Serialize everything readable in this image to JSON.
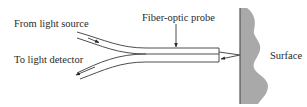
{
  "diagram": {
    "labels": {
      "source": "From light source",
      "detector": "To light detector",
      "probe": "Fiber-optic probe",
      "surface": "Surface"
    },
    "colors": {
      "line": "#3a3a3a",
      "surface_fill": "#a9a9a9",
      "text": "#2a2a2a"
    }
  }
}
